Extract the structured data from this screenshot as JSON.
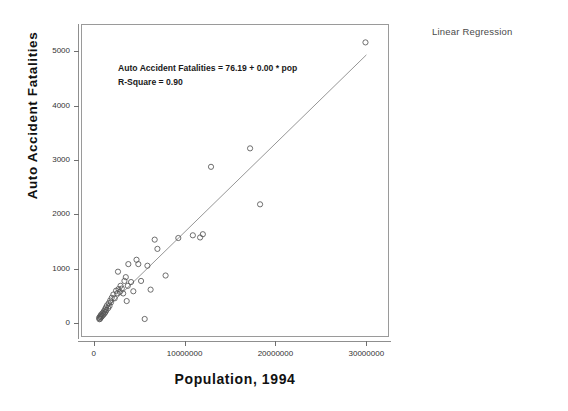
{
  "caption": {
    "corner_label": "Linear Regression"
  },
  "chart_data": {
    "type": "scatter",
    "title": "Linear Regression",
    "xlabel": "Population, 1994",
    "ylabel": "Auto Accident Fatalities",
    "xlim": [
      -1400000,
      32500000
    ],
    "ylim": [
      -260,
      5500
    ],
    "grid": false,
    "legend": false,
    "xticks": [
      0,
      10000000,
      20000000,
      30000000
    ],
    "xtick_labels": [
      "0",
      "10000000",
      "20000000",
      "30000000"
    ],
    "yticks": [
      0,
      1000,
      2000,
      3000,
      4000,
      5000
    ],
    "ytick_labels": [
      "0",
      "1000",
      "2000",
      "3000",
      "4000",
      "5000"
    ],
    "annotations": [
      "Auto Accident Fatalities = 76.19 + 0.00 * pop",
      "R-Square = 0.90"
    ],
    "fit": {
      "kind": "linear",
      "intercept": 76.19,
      "slope_display": "0.00",
      "slope": 0.000163,
      "r_square": 0.9,
      "equation": "Auto Accident Fatalities = 76.19 + 0.00 * pop",
      "r_square_label": "R-Square = 0.90",
      "line_x_start": 400000,
      "line_x_end": 29900000,
      "color": "#8a8a8a"
    },
    "marker": {
      "style": "open-circle",
      "size": 5.2,
      "edge_color": "#555555",
      "face_color": "none"
    },
    "n_points": 51,
    "points": [
      {
        "x": 480000,
        "y": 110
      },
      {
        "x": 520000,
        "y": 85
      },
      {
        "x": 580000,
        "y": 130
      },
      {
        "x": 600000,
        "y": 95
      },
      {
        "x": 640000,
        "y": 150
      },
      {
        "x": 700000,
        "y": 120
      },
      {
        "x": 730000,
        "y": 175
      },
      {
        "x": 800000,
        "y": 140
      },
      {
        "x": 880000,
        "y": 200
      },
      {
        "x": 940000,
        "y": 165
      },
      {
        "x": 1000000,
        "y": 230
      },
      {
        "x": 1060000,
        "y": 190
      },
      {
        "x": 1130000,
        "y": 265
      },
      {
        "x": 1170000,
        "y": 215
      },
      {
        "x": 1230000,
        "y": 300
      },
      {
        "x": 1280000,
        "y": 250
      },
      {
        "x": 1350000,
        "y": 340
      },
      {
        "x": 1480000,
        "y": 290
      },
      {
        "x": 1540000,
        "y": 380
      },
      {
        "x": 1630000,
        "y": 330
      },
      {
        "x": 1700000,
        "y": 430
      },
      {
        "x": 1790000,
        "y": 395
      },
      {
        "x": 1870000,
        "y": 480
      },
      {
        "x": 2050000,
        "y": 540
      },
      {
        "x": 2200000,
        "y": 470
      },
      {
        "x": 2350000,
        "y": 610
      },
      {
        "x": 2460000,
        "y": 560
      },
      {
        "x": 2560000,
        "y": 960
      },
      {
        "x": 2620000,
        "y": 640
      },
      {
        "x": 2760000,
        "y": 590
      },
      {
        "x": 2840000,
        "y": 700
      },
      {
        "x": 2980000,
        "y": 650
      },
      {
        "x": 3130000,
        "y": 560
      },
      {
        "x": 3270000,
        "y": 790
      },
      {
        "x": 3420000,
        "y": 860
      },
      {
        "x": 3520000,
        "y": 420
      },
      {
        "x": 3640000,
        "y": 700
      },
      {
        "x": 3700000,
        "y": 1100
      },
      {
        "x": 4000000,
        "y": 770
      },
      {
        "x": 4250000,
        "y": 600
      },
      {
        "x": 4600000,
        "y": 1180
      },
      {
        "x": 4800000,
        "y": 1100
      },
      {
        "x": 5100000,
        "y": 790
      },
      {
        "x": 5500000,
        "y": 90
      },
      {
        "x": 5800000,
        "y": 1070
      },
      {
        "x": 6150000,
        "y": 630
      },
      {
        "x": 6600000,
        "y": 1550
      },
      {
        "x": 6900000,
        "y": 1380
      },
      {
        "x": 7800000,
        "y": 890
      },
      {
        "x": 9200000,
        "y": 1580
      },
      {
        "x": 10800000,
        "y": 1630
      },
      {
        "x": 11600000,
        "y": 1590
      },
      {
        "x": 11900000,
        "y": 1650
      },
      {
        "x": 12800000,
        "y": 2890
      },
      {
        "x": 17100000,
        "y": 3230
      },
      {
        "x": 18200000,
        "y": 2200
      },
      {
        "x": 29800000,
        "y": 5180
      }
    ]
  }
}
